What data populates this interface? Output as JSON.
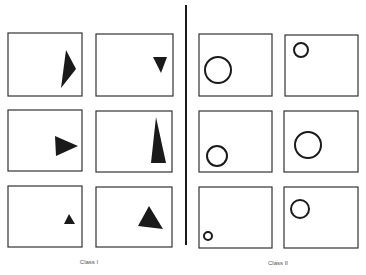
{
  "figure": {
    "width": 366,
    "height": 275,
    "background": "#ffffff",
    "ink_color": "#1a1a1a",
    "divider": {
      "x": 186,
      "y1": 5,
      "y2": 245
    },
    "classes": [
      {
        "label": "Class I",
        "label_pos": {
          "x": 89,
          "y": 259
        },
        "shape_type": "filled-triangle",
        "panels": [
          {
            "box": [
              8,
              33,
              74,
              63
            ],
            "triangle": [
              [
                66,
                50
              ],
              [
                76,
                69
              ],
              [
                61,
                88
              ]
            ]
          },
          {
            "box": [
              96,
              34,
              77,
              62
            ],
            "triangle": [
              [
                153,
                57
              ],
              [
                167,
                57
              ],
              [
                161,
                73
              ]
            ]
          },
          {
            "box": [
              8,
              110,
              74,
              61
            ],
            "triangle": [
              [
                55,
                136
              ],
              [
                78,
                146
              ],
              [
                56,
                156
              ]
            ]
          },
          {
            "box": [
              96,
              111,
              76,
              61
            ],
            "triangle": [
              [
                156,
                117
              ],
              [
                151,
                163
              ],
              [
                166,
                163
              ]
            ]
          },
          {
            "box": [
              8,
              186,
              74,
              61
            ],
            "triangle": [
              [
                69,
                214
              ],
              [
                64,
                224
              ],
              [
                75,
                224
              ]
            ]
          },
          {
            "box": [
              96,
              187,
              76,
              60
            ],
            "triangle": [
              [
                149,
                206
              ],
              [
                138,
                226
              ],
              [
                163,
                229
              ]
            ]
          }
        ]
      },
      {
        "label": "Class II",
        "label_pos": {
          "x": 278,
          "y": 260
        },
        "shape_type": "outline-circle",
        "panels": [
          {
            "box": [
              199,
              34,
              73,
              62
            ],
            "circle": {
              "cx": 218,
              "cy": 70,
              "r": 13
            }
          },
          {
            "box": [
              285,
              35,
              73,
              61
            ],
            "circle": {
              "cx": 301,
              "cy": 50,
              "r": 7
            }
          },
          {
            "box": [
              199,
              111,
              73,
              61
            ],
            "circle": {
              "cx": 217,
              "cy": 156,
              "r": 10
            }
          },
          {
            "box": [
              284,
              111,
              74,
              61
            ],
            "circle": {
              "cx": 308,
              "cy": 145,
              "r": 13
            }
          },
          {
            "box": [
              199,
              187,
              73,
              61
            ],
            "circle": {
              "cx": 208,
              "cy": 236,
              "r": 4
            }
          },
          {
            "box": [
              284,
              187,
              74,
              61
            ],
            "circle": {
              "cx": 300,
              "cy": 209,
              "r": 9
            }
          }
        ]
      }
    ]
  }
}
